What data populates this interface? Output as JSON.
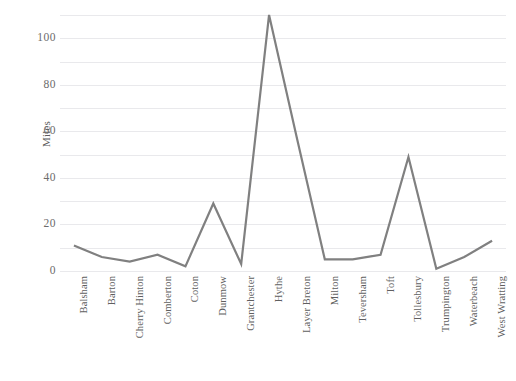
{
  "chart_data": {
    "type": "line",
    "title": "",
    "subtitle": "",
    "xlabel": "",
    "ylabel": "Miles",
    "categories": [
      "Balsham",
      "Barton",
      "Cherry Hinton",
      "Comberton",
      "Coton",
      "Dunmow",
      "Grantchester",
      "Hythe",
      "Layer Breton",
      "Milton",
      "Teversham",
      "Toft",
      "Tollesbury",
      "Trumpington",
      "Waterbeach",
      "West Wratting"
    ],
    "values": [
      11,
      6,
      4,
      7,
      2,
      29,
      3,
      110,
      57,
      5,
      5,
      7,
      49,
      1,
      6,
      13
    ],
    "series": [
      {
        "name": "Miles",
        "values": [
          11,
          6,
          4,
          7,
          2,
          29,
          3,
          110,
          57,
          5,
          5,
          7,
          49,
          1,
          6,
          13
        ],
        "color": "#808080"
      }
    ],
    "ylim": [
      0,
      113
    ],
    "yticks": [
      0,
      20,
      40,
      60,
      80,
      100
    ],
    "ytick_labels": [
      "0",
      "20",
      "40",
      "60",
      "80",
      "100"
    ],
    "grid": true,
    "grid_minor": true,
    "minor_yticks": [
      10,
      30,
      50,
      70,
      90,
      110
    ],
    "legend": false,
    "legend_position": "none",
    "markers": false,
    "line_width": 2.2,
    "colors": {
      "line": "#808080",
      "grid": "#e9e9ec",
      "text": "#5f5f5f",
      "background": "#ffffff"
    }
  }
}
